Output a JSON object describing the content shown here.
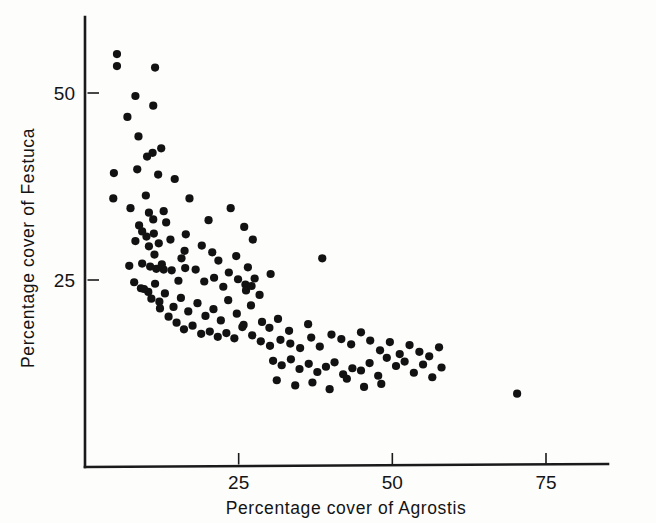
{
  "figure": {
    "background_color": "#fdfdfc",
    "ink_color": "#121212"
  },
  "chart_data": {
    "type": "scatter",
    "title": "",
    "xlabel": "Percentage  cover  of  Agrostis",
    "ylabel": "Percentage  cover  of  Festuca",
    "xlim": [
      0,
      79
    ],
    "ylim": [
      0,
      62
    ],
    "xticks": [
      25,
      50,
      75
    ],
    "xticklabels": [
      "25",
      "50",
      "75"
    ],
    "yticks": [
      25,
      50
    ],
    "yticklabels": [
      "25",
      "50"
    ],
    "grid": false,
    "legend": null,
    "marker": "filled-circle",
    "marker_color": "#121212",
    "marker_size_px": 4.6,
    "n_points": 148,
    "x": [
      5.2,
      5.2,
      11.4,
      8.2,
      11.1,
      6.9,
      8.7,
      11.0,
      10.1,
      12.4,
      4.7,
      8.5,
      11.9,
      4.6,
      7.4,
      9.9,
      10.4,
      14.6,
      8.8,
      12.8,
      9.3,
      11.1,
      17.0,
      13.2,
      8.2,
      10.0,
      10.4,
      11.2,
      11.3,
      12.0,
      13.9,
      15.7,
      16.2,
      12.8,
      20.1,
      16.4,
      23.7,
      25.9,
      27.3,
      20.7,
      19.0,
      21.7,
      24.6,
      26.5,
      30.2,
      26.1,
      27.6,
      7.2,
      9.3,
      10.6,
      11.6,
      12.5,
      14.1,
      15.2,
      16.3,
      18.0,
      19.4,
      21.0,
      22.5,
      23.4,
      24.9,
      26.2,
      27.1,
      28.4,
      8.0,
      9.1,
      10.3,
      11.4,
      12.1,
      13.0,
      14.4,
      15.6,
      16.8,
      18.3,
      19.6,
      20.9,
      22.1,
      23.3,
      24.7,
      25.8,
      27.0,
      28.8,
      30.0,
      31.4,
      33.2,
      36.3,
      38.6,
      9.6,
      10.8,
      12.2,
      13.6,
      14.9,
      16.1,
      17.5,
      18.9,
      20.3,
      21.6,
      23.0,
      24.3,
      25.6,
      27.2,
      28.6,
      30.1,
      31.8,
      33.4,
      35.0,
      36.8,
      38.2,
      40.1,
      41.7,
      43.3,
      44.9,
      46.4,
      48.0,
      49.6,
      51.2,
      52.8,
      54.4,
      56.0,
      57.6,
      30.6,
      32.0,
      33.5,
      34.9,
      36.4,
      37.8,
      39.2,
      40.6,
      42.0,
      43.5,
      44.9,
      46.3,
      47.7,
      49.1,
      50.6,
      52.0,
      53.5,
      55.0,
      56.5,
      58.0,
      31.2,
      34.2,
      37.0,
      39.8,
      42.6,
      45.4,
      48.2,
      70.3
    ],
    "y": [
      55.2,
      53.6,
      53.4,
      49.6,
      48.3,
      46.8,
      44.2,
      42.0,
      41.5,
      42.6,
      39.3,
      39.8,
      39.1,
      35.9,
      34.6,
      36.3,
      34.0,
      38.5,
      32.3,
      34.2,
      31.5,
      33.1,
      35.9,
      32.7,
      30.2,
      30.8,
      29.5,
      31.2,
      28.4,
      29.9,
      30.4,
      27.9,
      28.9,
      26.4,
      33.0,
      31.1,
      34.6,
      32.1,
      30.4,
      28.7,
      29.6,
      27.6,
      28.2,
      26.7,
      25.8,
      24.4,
      25.2,
      26.9,
      27.2,
      26.8,
      26.5,
      27.1,
      26.3,
      24.9,
      26.6,
      26.4,
      24.8,
      25.3,
      24.1,
      26.0,
      25.1,
      23.6,
      24.2,
      23.0,
      24.7,
      23.9,
      23.4,
      24.5,
      22.1,
      23.2,
      21.4,
      22.6,
      20.8,
      21.9,
      20.2,
      21.1,
      19.6,
      22.3,
      20.5,
      19.0,
      21.6,
      19.4,
      18.6,
      19.8,
      18.2,
      19.1,
      27.9,
      23.8,
      22.5,
      21.2,
      20.1,
      19.3,
      18.4,
      18.9,
      17.8,
      18.1,
      17.4,
      17.9,
      17.2,
      18.7,
      17.6,
      16.8,
      16.2,
      17.0,
      16.5,
      15.9,
      17.3,
      16.1,
      17.7,
      17.1,
      16.4,
      18.0,
      16.9,
      15.6,
      16.7,
      15.1,
      16.3,
      15.4,
      14.8,
      16.0,
      14.2,
      13.6,
      14.4,
      13.1,
      13.8,
      12.7,
      13.4,
      14.0,
      12.4,
      13.2,
      12.9,
      13.9,
      12.2,
      14.6,
      13.5,
      14.1,
      12.6,
      13.7,
      12.0,
      13.3,
      11.6,
      10.9,
      11.3,
      10.4,
      11.8,
      10.7,
      11.1,
      9.8
    ]
  },
  "axes": {
    "x_axis_name": "x-axis",
    "y_axis_name": "y-axis"
  }
}
